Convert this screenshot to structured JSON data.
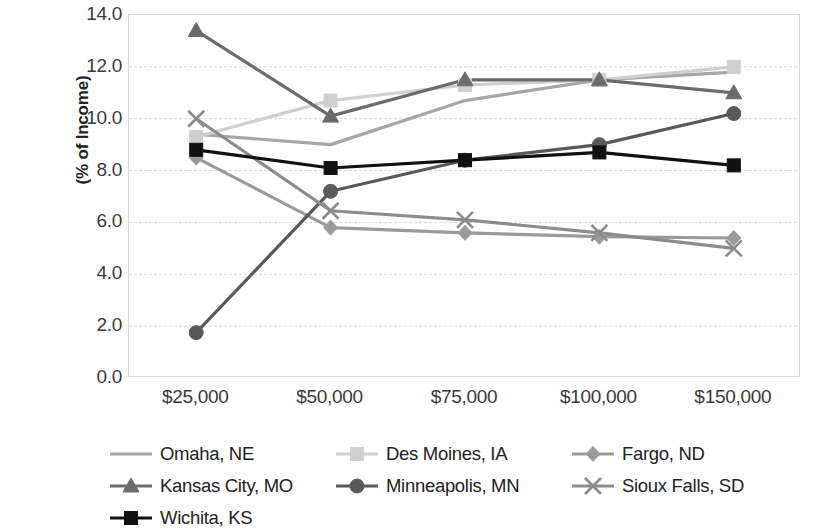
{
  "chart_data": {
    "type": "line",
    "title": "",
    "xlabel": "",
    "ylabel": "(% of Income)",
    "categories": [
      "$25,000",
      "$50,000",
      "$75,000",
      "$100,000",
      "$150,000"
    ],
    "ylim": [
      0.0,
      14.0
    ],
    "ytick_step": 2.0,
    "ytick_labels": [
      "14.0",
      "12.0",
      "10.0",
      "8.0",
      "6.0",
      "4.0",
      "2.0",
      "0.0"
    ],
    "grid": true,
    "legend_position": "bottom",
    "series": [
      {
        "name": "Omaha, NE",
        "marker": "none",
        "color": "#a6a6a6",
        "values": [
          9.4,
          9.0,
          10.7,
          11.5,
          11.8
        ]
      },
      {
        "name": "Des Moines, IA",
        "marker": "square",
        "color": "#cfcfcf",
        "values": [
          9.3,
          10.7,
          11.3,
          11.5,
          12.0
        ]
      },
      {
        "name": "Fargo, ND",
        "marker": "diamond",
        "color": "#9a9a9a",
        "values": [
          8.5,
          5.8,
          5.6,
          5.45,
          5.4
        ]
      },
      {
        "name": "Kansas City, MO",
        "marker": "triangle",
        "color": "#6b6b6b",
        "values": [
          13.4,
          10.1,
          11.5,
          11.5,
          11.0
        ]
      },
      {
        "name": "Minneapolis, MN",
        "marker": "circle",
        "color": "#595959",
        "values": [
          1.75,
          7.2,
          8.4,
          9.0,
          10.2
        ]
      },
      {
        "name": "Sioux Falls, SD",
        "marker": "cross",
        "color": "#8c8c8c",
        "values": [
          10.0,
          6.45,
          6.1,
          5.6,
          5.0
        ]
      },
      {
        "name": "Wichita, KS",
        "marker": "square",
        "color": "#111111",
        "values": [
          8.8,
          8.1,
          8.4,
          8.7,
          8.2
        ]
      }
    ]
  }
}
